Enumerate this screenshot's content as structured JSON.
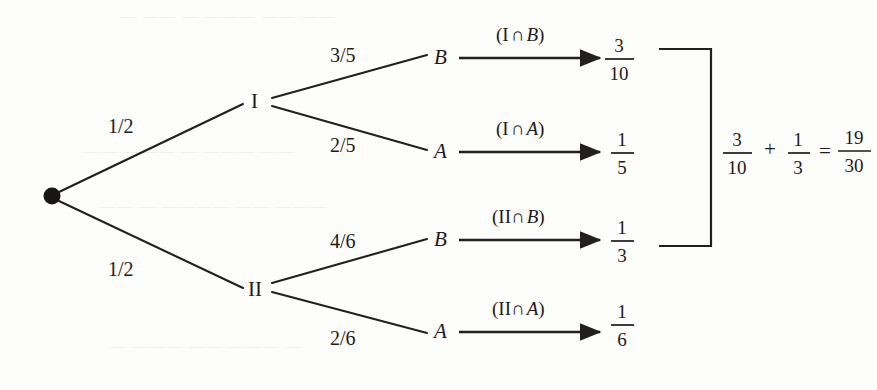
{
  "diagram": {
    "type": "probability-tree",
    "root": {
      "name": "root-node",
      "shape": "filled-dot"
    },
    "level1": [
      {
        "id": "I",
        "label": "I",
        "prob": "1/2"
      },
      {
        "id": "II",
        "label": "II",
        "prob": "1/2"
      }
    ],
    "branches": [
      {
        "id": "I-B",
        "parent": "I",
        "leaf": "B",
        "prob": "3/5",
        "event_open": "(",
        "event_first": "I",
        "event_symbol": "∩",
        "event_second": "B",
        "event_close": ")",
        "event_full": "(I ∩ B)",
        "result_num": "3",
        "result_den": "10",
        "result": "3/10"
      },
      {
        "id": "I-A",
        "parent": "I",
        "leaf": "A",
        "prob": "2/5",
        "event_open": "(",
        "event_first": "I",
        "event_symbol": "∩",
        "event_second": "A",
        "event_close": ")",
        "event_full": "(I ∩ A)",
        "result_num": "1",
        "result_den": "5",
        "result": "1/5"
      },
      {
        "id": "II-B",
        "parent": "II",
        "leaf": "B",
        "prob": "4/6",
        "event_open": "(",
        "event_first": "II",
        "event_symbol": "∩",
        "event_second": "B",
        "event_close": ")",
        "event_full": "(II ∩ B)",
        "result_num": "1",
        "result_den": "3",
        "result": "1/3"
      },
      {
        "id": "II-A",
        "parent": "II",
        "leaf": "A",
        "prob": "2/6",
        "event_open": "(",
        "event_first": "II",
        "event_symbol": "∩",
        "event_second": "A",
        "event_close": ")",
        "event_full": "(II ∩ A)",
        "result_num": "1",
        "result_den": "6",
        "result": "1/6"
      }
    ],
    "summary": {
      "bracket": "]",
      "term1_num": "3",
      "term1_den": "10",
      "operator": "+",
      "term2_num": "1",
      "term2_den": "3",
      "equals": "=",
      "total_num": "19",
      "total_den": "30",
      "expression": "3/10 + 1/3 = 19/30",
      "brackets_rows": [
        "3/10",
        "1/3"
      ]
    },
    "colors": {
      "ink": "#1d1a18",
      "paper": "#fdfdfc",
      "bleed": "#e9e7e4"
    }
  },
  "background_artifacts": [
    {
      "text": "—  —— —  ———  —— ——",
      "x": 120,
      "y": 16
    },
    {
      "text": "——  ———  — ——— ——",
      "x": 85,
      "y": 150
    },
    {
      "text": "—— —  ————  —— ———",
      "x": 100,
      "y": 205
    },
    {
      "text": "—  ——— ——  ——— —",
      "x": 110,
      "y": 345
    }
  ]
}
